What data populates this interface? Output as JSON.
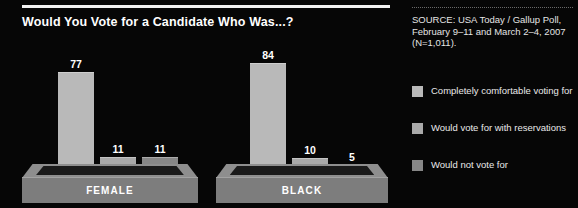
{
  "chart_data": {
    "type": "bar",
    "title": "Would You Vote for a Candidate Who Was...?",
    "categories": [
      "FEMALE",
      "BLACK"
    ],
    "series": [
      {
        "name": "Completely comfortable voting for",
        "values": [
          77,
          84
        ],
        "color": "#b9b9b9"
      },
      {
        "name": "Would vote for with reservations",
        "values": [
          11,
          10
        ],
        "color": "#a9a9a9"
      },
      {
        "name": "Would not vote for",
        "values": [
          11,
          5
        ],
        "color": "#878787"
      }
    ],
    "ylim": [
      0,
      100
    ],
    "xlabel": "",
    "ylabel": "",
    "grid": false,
    "legend_position": "right",
    "value_labels": true,
    "annotations": [
      "SOURCE: USA Today / Gallup Poll, February 9–11 and March 2–4, 2007 (N=1,011)."
    ]
  },
  "chart": {
    "title": "Would You Vote for a Candidate Who Was...?",
    "groups": [
      {
        "label": "FEMALE",
        "bars": [
          {
            "value": "77",
            "height_pct": 77
          },
          {
            "value": "11",
            "height_pct": 11
          },
          {
            "value": "11",
            "height_pct": 11
          }
        ]
      },
      {
        "label": "BLACK",
        "bars": [
          {
            "value": "84",
            "height_pct": 84
          },
          {
            "value": "10",
            "height_pct": 10
          },
          {
            "value": "5",
            "height_pct": 5
          }
        ]
      }
    ]
  },
  "info": {
    "source": "SOURCE: USA Today / Gallup Poll, February 9–11 and March 2–4, 2007 (N=1,011).",
    "legend": [
      {
        "label": "Completely comfortable voting for",
        "color": "#b9b9b9"
      },
      {
        "label": "Would vote for with reservations",
        "color": "#a9a9a9"
      },
      {
        "label": "Would not vote for",
        "color": "#878787"
      }
    ]
  },
  "colors": {
    "background": "#060606",
    "rule": "#f2f2f2",
    "pedestal_top": "#8e8e8e",
    "pedestal_face": "#7d7d7d",
    "series1": "#b9b9b9",
    "series2": "#a9a9a9",
    "series3": "#878787"
  }
}
